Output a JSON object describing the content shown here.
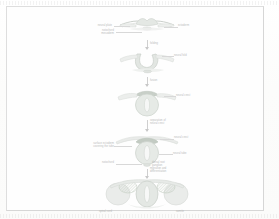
{
  "document": {
    "kind": "scanned-figure-page",
    "title": "Neurulation — formation of the neural tube",
    "page_background": "#fdfdfd",
    "frame_color": "#dedede",
    "ink_color": "#b9b9b9",
    "legibility_note": "faded scan; label text rendered as faint illegible grey marks"
  },
  "figure": {
    "name": "neural-tube-development-sequence",
    "orientation": "vertical",
    "stage_count": 5,
    "stages": [
      {
        "index": 1,
        "name": "neural-plate",
        "caption": "",
        "labels": [
          {
            "id": "s1-l1",
            "text": "neural plate",
            "side": "left"
          },
          {
            "id": "s1-l2",
            "text": "ectoderm",
            "side": "right"
          },
          {
            "id": "s1-l3",
            "text": "notochord\nmesoderm",
            "side": "left"
          }
        ]
      },
      {
        "index": 2,
        "name": "neural-groove",
        "caption": "",
        "labels": [
          {
            "id": "s2-l1",
            "text": "neural fold",
            "side": "right"
          }
        ]
      },
      {
        "index": 3,
        "name": "neural-fold-closing",
        "caption": "",
        "labels": [
          {
            "id": "s3-l1",
            "text": "neural crest",
            "side": "right"
          }
        ]
      },
      {
        "index": 4,
        "name": "neural-tube-closed",
        "caption": "",
        "labels": [
          {
            "id": "s4-l1",
            "text": "neural crest",
            "side": "right"
          },
          {
            "id": "s4-l2",
            "text": "surface ectoderm\ncovering the tube",
            "side": "left"
          },
          {
            "id": "s4-l3",
            "text": "neural tube",
            "side": "right"
          },
          {
            "id": "s4-l4",
            "text": "notochord",
            "side": "left"
          },
          {
            "id": "s4-l5",
            "text": "dorsal root\nganglion",
            "side": "right"
          }
        ]
      },
      {
        "index": 5,
        "name": "somite-differentiation",
        "caption": "",
        "labels": [
          {
            "id": "s5-l1",
            "text": "spinal cord",
            "side": "left"
          },
          {
            "id": "s5-l2",
            "text": "somite",
            "side": "right"
          }
        ]
      }
    ],
    "connectors": [
      {
        "id": "c1",
        "from": 1,
        "to": 2,
        "annotation": "folding"
      },
      {
        "id": "c2",
        "from": 2,
        "to": 3,
        "annotation": "fusion"
      },
      {
        "id": "c3",
        "from": 3,
        "to": 4,
        "annotation": "separation of\nneural crest"
      },
      {
        "id": "c4",
        "from": 4,
        "to": 5,
        "annotation": "migration and\ndifferentiation"
      }
    ]
  },
  "palette": {
    "paper": "#fdfdfd",
    "frame": "#dedede",
    "tissue_light": "#eceeec",
    "tissue_mid": "#dfe3df",
    "tissue_dark": "#cfd6cf",
    "somite_hatch": "#c9d2c6",
    "outline": "#d2d6d2",
    "text": "#b9b9b9"
  }
}
